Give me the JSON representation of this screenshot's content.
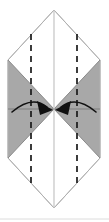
{
  "figure": {
    "type": "origami-instruction-diagram",
    "canvas": {
      "width": 109,
      "height": 222,
      "background": "#ffffff"
    },
    "colors": {
      "paper_fill": "#ffffff",
      "shaded_fill": "#a8a8a8",
      "outline": "#b5b5b5",
      "crease_line": "#c8c8c8",
      "fold_line": "#1a1a1a",
      "arrow": "#111111",
      "bottom_rule": "#d8d8d8"
    },
    "shape": {
      "name": "hexagon-outline",
      "description": "Tall hexagon formed by two triangles meeting at left and right corner points",
      "points": "54,10 100,60 100,158 54,208 8,158 8,60",
      "top_apex": {
        "x": 54,
        "y": 10
      },
      "bottom_apex": {
        "x": 54,
        "y": 208
      },
      "left_top": {
        "x": 8,
        "y": 60
      },
      "left_bottom": {
        "x": 8,
        "y": 158
      },
      "right_top": {
        "x": 100,
        "y": 60
      },
      "right_bottom": {
        "x": 100,
        "y": 158
      }
    },
    "shaded_regions": [
      {
        "name": "left-shaded-triangle-upper",
        "points": "8,60 54,109 8,109",
        "fill": "#a8a8a8"
      },
      {
        "name": "left-shaded-triangle-lower",
        "points": "8,109 54,109 8,158",
        "fill": "#a8a8a8"
      },
      {
        "name": "right-shaded-triangle-upper",
        "points": "100,60 100,109 54,109",
        "fill": "#a8a8a8"
      },
      {
        "name": "right-shaded-triangle-lower",
        "points": "100,109 100,158 54,109",
        "fill": "#a8a8a8"
      }
    ],
    "crease_lines": [
      {
        "name": "vertical-center-crease",
        "x1": 54,
        "y1": 10,
        "x2": 54,
        "y2": 208,
        "style": "solid",
        "color": "#c8c8c8"
      },
      {
        "name": "horizontal-center-crease",
        "x1": 8,
        "y1": 109,
        "x2": 100,
        "y2": 109,
        "style": "solid",
        "color": "#888888"
      },
      {
        "name": "diagonal-crease-upper-left",
        "x1": 8,
        "y1": 60,
        "x2": 54,
        "y2": 109,
        "style": "solid",
        "color": "#8a8a8a"
      },
      {
        "name": "diagonal-crease-upper-right",
        "x1": 100,
        "y1": 60,
        "x2": 54,
        "y2": 109,
        "style": "solid",
        "color": "#8a8a8a"
      },
      {
        "name": "diagonal-crease-lower-left",
        "x1": 8,
        "y1": 158,
        "x2": 54,
        "y2": 109,
        "style": "solid",
        "color": "#8a8a8a"
      },
      {
        "name": "diagonal-crease-lower-right",
        "x1": 100,
        "y1": 158,
        "x2": 54,
        "y2": 109,
        "style": "solid",
        "color": "#8a8a8a"
      }
    ],
    "fold_lines": [
      {
        "name": "left-valley-fold-line",
        "x": 31,
        "y1": 34,
        "y2": 184,
        "style": "dashed",
        "dash": "6 5",
        "color": "#1a1a1a",
        "width": 1.7
      },
      {
        "name": "right-valley-fold-line",
        "x": 77,
        "y1": 34,
        "y2": 184,
        "style": "dashed",
        "dash": "6 5",
        "color": "#1a1a1a",
        "width": 1.7
      }
    ],
    "arrows": [
      {
        "name": "left-fold-arrow",
        "direction": "right",
        "description": "Curved arrow from left edge sweeping right to the center point",
        "path": "M 12,112 Q 32,95 48,108",
        "head_points": "52,110 38,103 40,114",
        "color": "#111111"
      },
      {
        "name": "right-fold-arrow",
        "direction": "left",
        "description": "Curved arrow from right edge sweeping left to the center point",
        "path": "M 96,112 Q 76,95 60,108",
        "head_points": "56,110 70,103 68,114",
        "color": "#111111"
      }
    ],
    "bottom_rule": {
      "name": "bottom-separator-rule",
      "x1": 0,
      "y1": 219,
      "x2": 109,
      "y2": 219,
      "color": "#dcdcdc"
    }
  }
}
